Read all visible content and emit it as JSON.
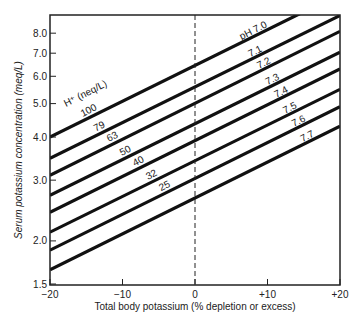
{
  "chart_data": {
    "type": "line",
    "title": "",
    "xlabel": "Total body potassium (% depletion or excess)",
    "ylabel": "Serum potassium concentration (meq/L)",
    "xlim": [
      -20,
      20
    ],
    "ylim": [
      1.5,
      8.6
    ],
    "yscale": "log",
    "x_ticks": [
      "-20",
      "-10",
      "0",
      "+10",
      "+20"
    ],
    "y_ticks": [
      "1.5",
      "2.0",
      "3.0",
      "4.0",
      "5.0",
      "6.0",
      "7.0",
      "8.0"
    ],
    "reference_line": {
      "x": 0,
      "style": "dashed"
    },
    "legend_title_left": "H⁺ (neq/L)",
    "x": [
      -20,
      20
    ],
    "series": [
      {
        "name": "pH 7.0",
        "label": "pH 7.0",
        "h_label": "100",
        "values": [
          4.0,
          10.4
        ]
      },
      {
        "name": "pH 7.1",
        "label": "7.1",
        "h_label": "79",
        "values": [
          3.47,
          9.0
        ]
      },
      {
        "name": "pH 7.2",
        "label": "7.2",
        "h_label": "63",
        "values": [
          3.1,
          8.1
        ]
      },
      {
        "name": "pH 7.3",
        "label": "7.3",
        "h_label": "50",
        "values": [
          2.71,
          7.05
        ]
      },
      {
        "name": "pH 7.4",
        "label": "7.4",
        "h_label": "40",
        "values": [
          2.42,
          6.3
        ]
      },
      {
        "name": "pH 7.5",
        "label": "7.5",
        "h_label": "32",
        "values": [
          2.12,
          5.5
        ]
      },
      {
        "name": "pH 7.6",
        "label": "7.6",
        "h_label": "25",
        "values": [
          1.88,
          4.9
        ]
      },
      {
        "name": "pH 7.7",
        "label": "7.7",
        "h_label": "",
        "values": [
          1.65,
          4.3
        ]
      }
    ]
  }
}
